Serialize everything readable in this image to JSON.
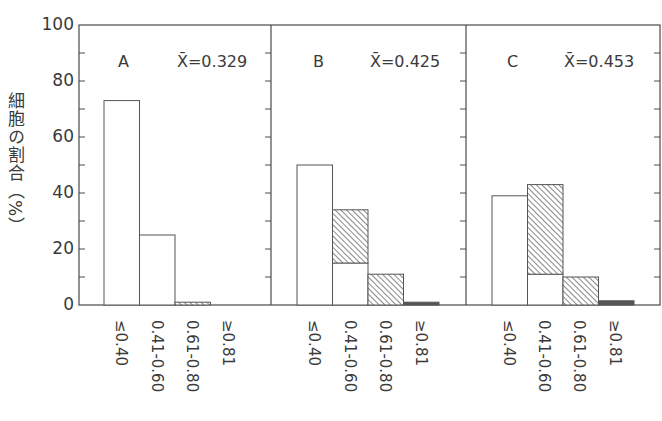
{
  "chart_data": {
    "type": "bar",
    "title": "",
    "ylabel": "細胞の割合（%）",
    "xlabel": "",
    "ylim": [
      0,
      100
    ],
    "yticks": [
      0,
      20,
      40,
      60,
      80,
      100
    ],
    "grid": false,
    "categories": [
      "≤0.40",
      "0.41-0.60",
      "0.61-0.80",
      "≥0.81"
    ],
    "panels": [
      {
        "label": "A",
        "mean_label": "X̄=0.329",
        "series": [
          {
            "name": "white",
            "values": [
              73,
              25,
              0,
              0
            ]
          },
          {
            "name": "hatched",
            "values": [
              0,
              0,
              1,
              0
            ]
          },
          {
            "name": "dark",
            "values": [
              0,
              0,
              0,
              0
            ]
          }
        ]
      },
      {
        "label": "B",
        "mean_label": "X̄=0.425",
        "series": [
          {
            "name": "white",
            "values": [
              50,
              15,
              0,
              0
            ]
          },
          {
            "name": "hatched",
            "values": [
              0,
              19,
              11,
              0
            ]
          },
          {
            "name": "dark",
            "values": [
              0,
              0,
              0,
              1
            ]
          }
        ]
      },
      {
        "label": "C",
        "mean_label": "X̄=0.453",
        "series": [
          {
            "name": "white",
            "values": [
              39,
              11,
              0,
              0
            ]
          },
          {
            "name": "hatched",
            "values": [
              0,
              32,
              10,
              0
            ]
          },
          {
            "name": "dark",
            "values": [
              0,
              0,
              0,
              1.5
            ]
          }
        ]
      }
    ]
  },
  "labels": {
    "ylabel": "細胞の割合（%）",
    "yticks": [
      "0",
      "20",
      "40",
      "60",
      "80",
      "100"
    ],
    "x": [
      "≤0.40",
      "0.41-0.60",
      "0.61-0.80",
      "≥0.81"
    ],
    "panelA": {
      "letter": "A",
      "mean": "X̄=0.329"
    },
    "panelB": {
      "letter": "B",
      "mean": "X̄=0.425"
    },
    "panelC": {
      "letter": "C",
      "mean": "X̄=0.453"
    }
  },
  "colors": {
    "axis": "#4a4a4a",
    "bar_stroke": "#555555",
    "bar_fill": "#ffffff",
    "hatch": "#555555",
    "dark": "#555555"
  }
}
